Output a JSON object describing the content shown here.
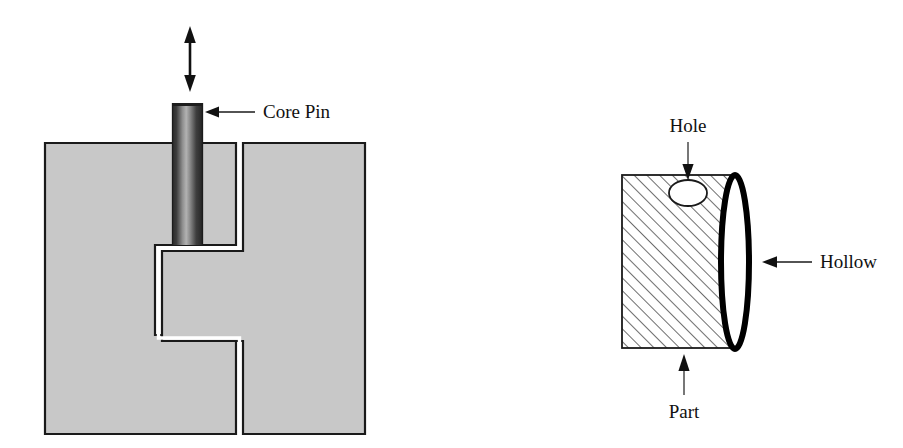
{
  "figure": {
    "background_color": "#ffffff",
    "width": 903,
    "height": 448
  },
  "colors": {
    "mold_fill": "#c8c8c8",
    "mold_outline": "#1a1a1a",
    "pin_dark": "#2b2b2b",
    "pin_light": "#b4b4b4",
    "hatch_line": "#4a4a4a",
    "part_outline": "#1a1a1a",
    "hollow_outline": "#000000",
    "hole_fill": "#ffffff",
    "label_text": "#111111",
    "leader_line": "#1a1a1a"
  },
  "left_diagram": {
    "name": "mold-cross-section",
    "labels": {
      "core_pin": "Core Pin"
    },
    "icons": {
      "motion_arrow": "double-headed-vertical-arrow",
      "leader_arrow": "left-pointing-arrow"
    }
  },
  "right_diagram": {
    "name": "molded-part-isometric",
    "labels": {
      "hole": "Hole",
      "hollow": "Hollow",
      "part": "Part"
    },
    "icons": {
      "hole_arrow": "down-pointing-arrow",
      "hollow_arrow": "left-pointing-arrow",
      "part_arrow": "up-pointing-arrow"
    }
  }
}
